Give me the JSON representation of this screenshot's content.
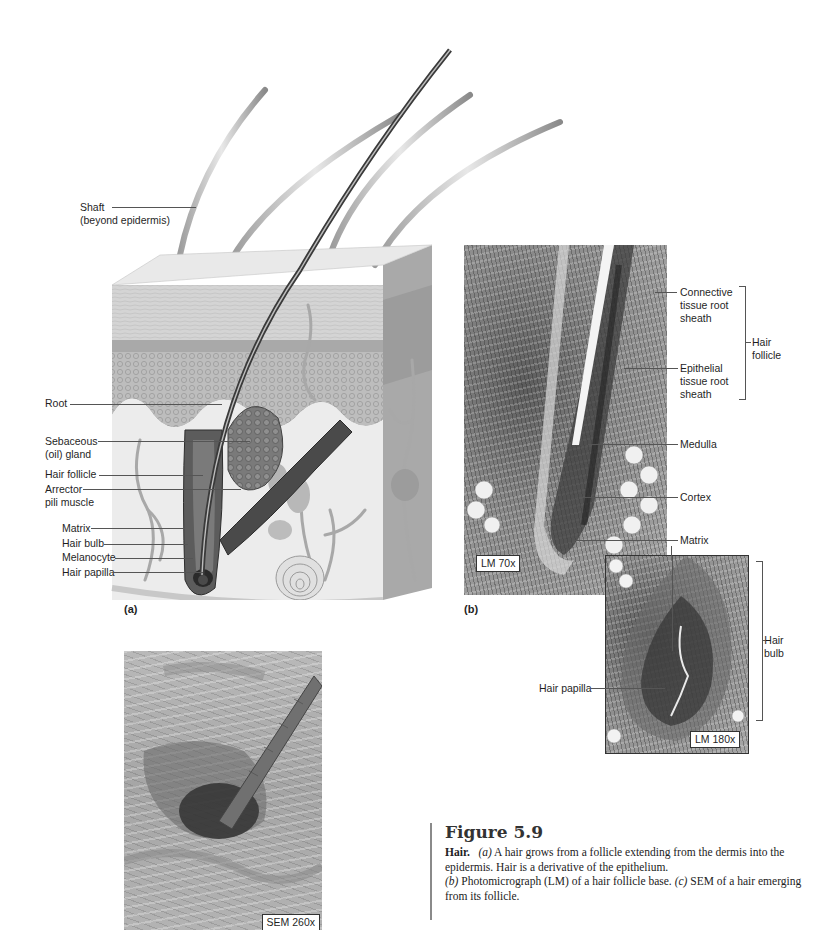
{
  "figure": {
    "number": "Figure 5.9",
    "caption": {
      "lead": "Hair.",
      "a_marker": "(a)",
      "a_text": " A hair grows from a follicle extending from the dermis into the epidermis. Hair is a derivative of the epithelium.",
      "b_marker": "(b)",
      "b_text": " Photomicrograph (LM) of a hair follicle base. ",
      "c_marker": "(c)",
      "c_text": " SEM of a hair emerging from its follicle."
    }
  },
  "panel_a": {
    "letter": "(a)",
    "labels": {
      "shaft_line1": "Shaft",
      "shaft_line2": "(beyond epidermis)",
      "root": "Root",
      "sebaceous_line1": "Sebaceous",
      "sebaceous_line2": "(oil) gland",
      "hair_follicle": "Hair follicle",
      "arrector_line1": "Arrector",
      "arrector_line2": "pili muscle",
      "matrix": "Matrix",
      "hair_bulb": "Hair bulb",
      "melanocyte": "Melanocyte",
      "hair_papilla": "Hair papilla"
    }
  },
  "panel_b": {
    "letter": "(b)",
    "magnification": "LM 70x",
    "inset_magnification": "LM 180x",
    "labels": {
      "connective_line1": "Connective",
      "connective_line2": "tissue root",
      "connective_line3": "sheath",
      "epithelial_line1": "Epithelial",
      "epithelial_line2": "tissue root",
      "epithelial_line3": "sheath",
      "hair_follicle_line1": "Hair",
      "hair_follicle_line2": "follicle",
      "medulla": "Medulla",
      "cortex": "Cortex",
      "matrix": "Matrix",
      "hair_bulb_line1": "Hair",
      "hair_bulb_line2": "bulb",
      "hair_papilla": "Hair papilla"
    }
  },
  "panel_c": {
    "magnification": "SEM 260x"
  }
}
